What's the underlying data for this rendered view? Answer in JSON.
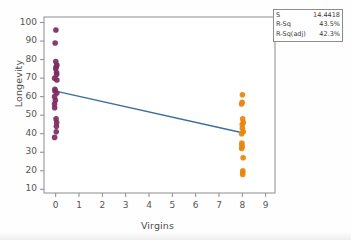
{
  "chart_data": {
    "type": "scatter",
    "title": "",
    "xlabel": "Virgins",
    "ylabel": "Longevity",
    "xlim": [
      -0.5,
      9.4
    ],
    "ylim": [
      8,
      103
    ],
    "xticks": [
      0,
      1,
      2,
      3,
      4,
      5,
      6,
      7,
      8,
      9
    ],
    "yticks": [
      10,
      20,
      30,
      40,
      50,
      60,
      70,
      80,
      90,
      100
    ],
    "grid": false,
    "legend": "none",
    "series": [
      {
        "name": "Virgins = 0",
        "color": "#7B2D62",
        "marker": "filled-circle",
        "x": [
          0,
          0,
          0,
          0,
          0,
          0,
          0,
          0,
          0,
          0,
          0,
          0,
          0,
          0,
          0,
          0,
          0,
          0,
          0,
          0,
          0,
          0
        ],
        "y": [
          96,
          89,
          79,
          77,
          76,
          75,
          73,
          72,
          70,
          69,
          64,
          63,
          62,
          60,
          58,
          56,
          54,
          48,
          46,
          44,
          41,
          38
        ]
      },
      {
        "name": "Virgins = 8",
        "color": "#E8860C",
        "marker": "filled-circle",
        "x": [
          8,
          8,
          8,
          8,
          8,
          8,
          8,
          8,
          8,
          8,
          8,
          8,
          8,
          8,
          8,
          8,
          8
        ],
        "y": [
          61,
          57,
          56,
          48,
          46,
          45,
          43,
          41,
          40,
          35,
          34,
          33,
          32,
          27,
          20,
          19,
          18
        ]
      }
    ],
    "fit_line": {
      "name": "regression-line",
      "color": "#3B6E9E",
      "x": [
        0,
        8
      ],
      "y": [
        63.0,
        40.5
      ]
    }
  },
  "stats_box": {
    "rows": [
      {
        "key": "S",
        "value": "14.4418"
      },
      {
        "key": "R-Sq",
        "value": "43.5%"
      },
      {
        "key": "R-Sq(adj)",
        "value": "42.3%"
      }
    ]
  },
  "axes": {
    "x_title": "Virgins",
    "y_title": "Longevity",
    "x_tick_labels": [
      "0",
      "1",
      "2",
      "3",
      "4",
      "5",
      "6",
      "7",
      "8",
      "9"
    ],
    "y_tick_labels": [
      "100",
      "90",
      "80",
      "70",
      "60",
      "50",
      "40",
      "30",
      "20",
      "10"
    ]
  },
  "colors": {
    "purple": "#7B2D62",
    "orange": "#E8860C",
    "line": "#3B6E9E",
    "frame": "#8c8c8c",
    "text": "#4d4d4d"
  }
}
